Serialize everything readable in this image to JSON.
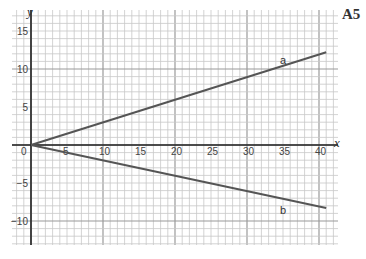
{
  "page": {
    "label": "A5"
  },
  "chart_data": {
    "type": "line",
    "title": "",
    "xlabel": "x",
    "ylabel": "y",
    "xlim": [
      0,
      42
    ],
    "ylim": [
      -12,
      17
    ],
    "grid": true,
    "x_ticks": [
      0,
      5,
      10,
      15,
      20,
      25,
      30,
      35,
      40
    ],
    "y_ticks": [
      -10,
      -5,
      0,
      5,
      10,
      15
    ],
    "y_tick_labels": [
      "−10",
      "−5",
      "0",
      "5",
      "10",
      "15"
    ],
    "series": [
      {
        "name": "a",
        "x": [
          0,
          41
        ],
        "y": [
          0,
          12.2
        ],
        "label_at": [
          35,
          11.2
        ]
      },
      {
        "name": "b",
        "x": [
          0,
          41
        ],
        "y": [
          0,
          -8.3
        ],
        "label_at": [
          35,
          -8.6
        ]
      }
    ],
    "colors": {
      "line": "#555555",
      "axis": "#222222",
      "grid_minor": "#c8c8c8",
      "grid_major": "#9a9a9a"
    }
  }
}
